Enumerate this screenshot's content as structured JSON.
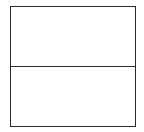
{
  "diagram": {
    "type": "stacked-boxes",
    "rows": 2,
    "columns": 1,
    "border_color": "#2b2b2b",
    "background_color": "#ffffff",
    "cells": [
      {
        "position": "top",
        "label": ""
      },
      {
        "position": "bottom",
        "label": ""
      }
    ]
  }
}
